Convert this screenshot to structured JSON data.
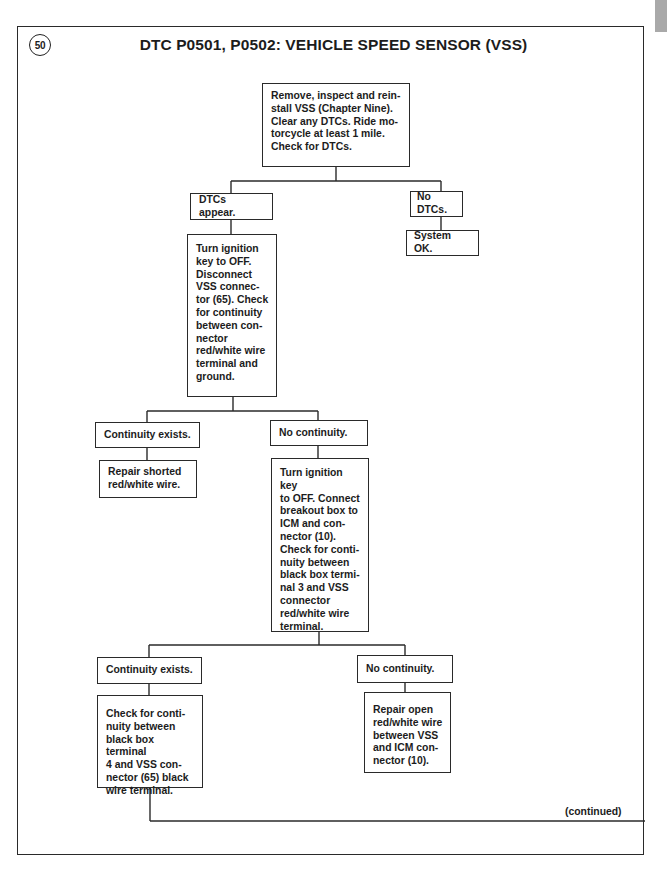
{
  "figure": {
    "number": "50",
    "title": "DTC P0501, P0502: VEHICLE SPEED SENSOR (VSS)"
  },
  "nodes": {
    "start": "Remove, inspect and rein-\nstall VSS (Chapter Nine).\nClear any DTCs. Ride mo-\ntorcycle at least 1 mile.\nCheck for DTCs.",
    "dtcs_appear": "DTCs appear.",
    "no_dtcs": "No DTCs.",
    "system_ok": "System OK.",
    "check_ground": "Turn ignition\nkey to OFF.\nDisconnect\nVSS connec-\ntor (65). Check\nfor continuity\nbetween con-\nnector\nred/white wire\nterminal and\nground.",
    "continuity_exists_1": "Continuity exists.",
    "repair_shorted": "Repair shorted\nred/white wire.",
    "no_continuity_1": "No continuity.",
    "breakout_check": "Turn ignition key\nto OFF. Connect\nbreakout box to\nICM and con-\nnector (10).\nCheck for conti-\nnuity between\nblack box termi-\nnal 3 and VSS\nconnector\nred/white wire\nterminal.",
    "continuity_exists_2": "Continuity exists.",
    "check_black_wire": "Check for conti-\nnuity between\nblack box terminal\n4 and VSS con-\nnector (65) black\nwire terminal.",
    "no_continuity_2": "No continuity.",
    "repair_open": "Repair open\nred/white wire\nbetween VSS\nand ICM con-\nnector (10)."
  },
  "footer": {
    "continued": "(continued)"
  }
}
